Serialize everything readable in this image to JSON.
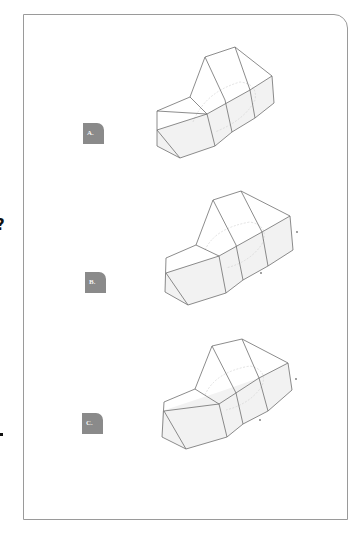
{
  "page": {
    "edge_fragments": {
      "question_mark": "?",
      "period": "."
    }
  },
  "options": [
    {
      "id": "A",
      "label": "A."
    },
    {
      "id": "B",
      "label": "B."
    },
    {
      "id": "C",
      "label": "C."
    }
  ],
  "colors": {
    "frame_border": "#9a9a9a",
    "label_bg": "#8a8a8a",
    "label_text": "#f4f4f4",
    "edge_stroke": "#6f6f6f"
  }
}
